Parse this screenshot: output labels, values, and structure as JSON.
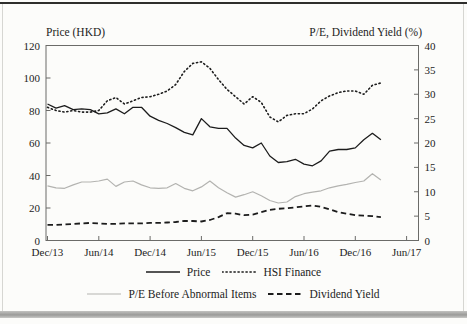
{
  "page": {
    "left_axis_title": "Price (HKD)",
    "right_axis_title": "P/E, Dividend Yield (%)"
  },
  "colors": {
    "ink": "#1c1c1c",
    "gray_line": "#b3b3b0",
    "frame": "#6b6b68",
    "page_bg": "#fcfcfa",
    "bottom_bar": "#9b9b99"
  },
  "chart_data": {
    "type": "line",
    "title": "",
    "xlabel": "",
    "left_axis": {
      "title": "Price (HKD)",
      "range": [
        0,
        120
      ],
      "ticks": [
        0,
        20,
        40,
        60,
        80,
        100,
        120
      ]
    },
    "right_axis": {
      "title": "P/E, Dividend Yield (%)",
      "range": [
        0,
        40
      ],
      "ticks": [
        0,
        5,
        10,
        15,
        20,
        25,
        30,
        35,
        40
      ]
    },
    "x_tick_labels": [
      "Dec/13",
      "Jun/14",
      "Dec/14",
      "Jun/15",
      "Dec/15",
      "Jun/16",
      "Dec/16",
      "Jun/17"
    ],
    "grid": false,
    "legend_position": "bottom",
    "legend_rows": [
      [
        0,
        1
      ],
      [
        2,
        3
      ]
    ],
    "x": [
      "Dec/13",
      "Jan/14",
      "Feb/14",
      "Mar/14",
      "Apr/14",
      "May/14",
      "Jun/14",
      "Jul/14",
      "Aug/14",
      "Sep/14",
      "Oct/14",
      "Nov/14",
      "Dec/14",
      "Jan/15",
      "Feb/15",
      "Mar/15",
      "Apr/15",
      "May/15",
      "Jun/15",
      "Jul/15",
      "Aug/15",
      "Sep/15",
      "Oct/15",
      "Nov/15",
      "Dec/15",
      "Jan/16",
      "Feb/16",
      "Mar/16",
      "Apr/16",
      "May/16",
      "Jun/16",
      "Jul/16",
      "Aug/16",
      "Sep/16",
      "Oct/16",
      "Nov/16",
      "Dec/16",
      "Jan/17",
      "Feb/17",
      "Mar/17"
    ],
    "series": [
      {
        "name": "Price",
        "axis": "left",
        "style": "solid-dark",
        "values": [
          84,
          81.5,
          83,
          80.5,
          81,
          80.5,
          78,
          78.5,
          81,
          78,
          82,
          82,
          76.5,
          74,
          72,
          69.5,
          66.5,
          65,
          75,
          70,
          69,
          69,
          63,
          58.5,
          57,
          60,
          52,
          48,
          48.5,
          50,
          47,
          46,
          49,
          55,
          56,
          56,
          57,
          62,
          66,
          62
        ]
      },
      {
        "name": "HSI Finance",
        "axis": "left",
        "style": "dotted",
        "values": [
          82,
          80,
          79,
          80,
          79,
          79,
          80,
          86,
          88,
          84,
          86,
          88,
          88.5,
          90,
          92,
          96,
          104,
          109,
          110,
          106,
          99,
          93,
          88.5,
          84,
          88.5,
          85,
          76,
          73,
          77,
          78,
          78,
          81,
          86,
          89,
          91,
          92,
          92,
          90,
          95.5,
          97
        ]
      },
      {
        "name": "P/E Before Abnormal Items",
        "axis": "right",
        "style": "solid-gray",
        "values": [
          11.2,
          10.8,
          10.7,
          11.4,
          12.0,
          12.0,
          12.2,
          12.6,
          11.1,
          12.0,
          12.2,
          11.4,
          10.8,
          10.7,
          10.8,
          11.7,
          10.7,
          10.2,
          11.0,
          12.2,
          10.8,
          9.8,
          8.9,
          9.4,
          10.0,
          9.2,
          8.2,
          7.7,
          7.9,
          9.0,
          9.6,
          9.9,
          10.2,
          10.8,
          11.2,
          11.5,
          11.9,
          12.2,
          13.7,
          12.4
        ]
      },
      {
        "name": "Dividend Yield",
        "axis": "right",
        "style": "dashed",
        "values": [
          3.2,
          3.2,
          3.3,
          3.4,
          3.5,
          3.6,
          3.5,
          3.4,
          3.4,
          3.5,
          3.5,
          3.5,
          3.6,
          3.6,
          3.7,
          3.8,
          4.0,
          4.0,
          3.9,
          4.2,
          4.8,
          5.6,
          5.5,
          5.2,
          5.3,
          5.8,
          6.3,
          6.5,
          6.6,
          6.8,
          7.0,
          7.2,
          6.9,
          6.4,
          5.8,
          5.5,
          5.2,
          5.1,
          5.0,
          4.8
        ]
      }
    ]
  }
}
